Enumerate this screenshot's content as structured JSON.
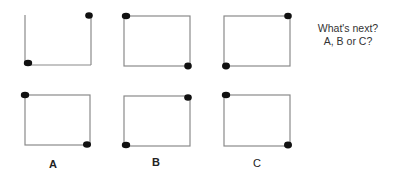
{
  "question": {
    "line1": "What's next?",
    "line2": "A, B or C?"
  },
  "colors": {
    "box_stroke": "#8a8a8a",
    "dot": "#111111",
    "text": "#333333"
  },
  "sequence": [
    {
      "name": "sequence-box-1",
      "box": [
        25,
        15,
        66,
        50
      ],
      "dots": [
        "top-right",
        "bottom-left"
      ],
      "top_edge_faded": true
    },
    {
      "name": "sequence-box-2",
      "box": [
        124,
        16,
        66,
        50
      ],
      "dots": [
        "top-left",
        "bottom-right"
      ]
    },
    {
      "name": "sequence-box-3",
      "box": [
        224,
        16,
        66,
        50
      ],
      "dots": [
        "top-right",
        "bottom-left"
      ]
    }
  ],
  "options": [
    {
      "label": "A",
      "box": [
        25,
        95,
        65,
        50
      ],
      "dots": [
        "top-left",
        "bottom-right"
      ]
    },
    {
      "label": "B",
      "box": [
        124,
        96,
        66,
        50
      ],
      "dots": [
        "top-right",
        "bottom-left"
      ]
    },
    {
      "label": "C",
      "box": [
        224,
        95,
        66,
        51
      ],
      "dots": [
        "top-left",
        "bottom-right"
      ]
    }
  ]
}
